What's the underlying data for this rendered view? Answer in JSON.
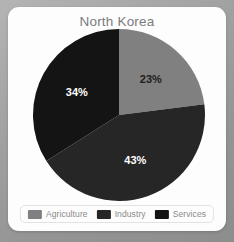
{
  "card": {
    "background_color": "#fdfdfd",
    "surround_color": "#9c9c9c"
  },
  "chart_data": {
    "type": "pie",
    "title": "North Korea",
    "xlabel": "",
    "ylabel": "",
    "categories": [
      "Agriculture",
      "Industry",
      "Services"
    ],
    "values": [
      23,
      43,
      34
    ],
    "value_unit": "%",
    "data_labels": [
      "23%",
      "43%",
      "34%"
    ],
    "colors": [
      "#808080",
      "#262626",
      "#141414"
    ],
    "label_text_colors": [
      "#1d1d1d",
      "#ffffff",
      "#ffffff"
    ],
    "start_angle_deg": 0,
    "direction": "clockwise",
    "legend_position": "bottom",
    "grid": false,
    "title_color": "#7b7b7b"
  },
  "legend": {
    "items": [
      {
        "label": "Agriculture",
        "color": "#808080"
      },
      {
        "label": "Industry",
        "color": "#262626"
      },
      {
        "label": "Services",
        "color": "#141414"
      }
    ]
  }
}
